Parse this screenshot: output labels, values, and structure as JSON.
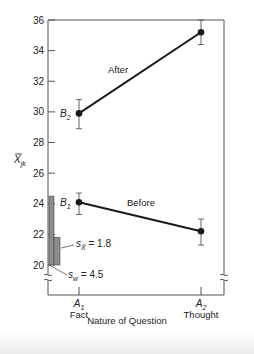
{
  "chart_data": {
    "type": "line",
    "title": "",
    "xlabel": "Nature of Question",
    "ylabel": "X̄jk",
    "ylabel_main": "X",
    "ylabel_sub": "jk",
    "ylim": [
      20,
      36
    ],
    "yticks": [
      20,
      22,
      24,
      26,
      28,
      30,
      32,
      34,
      36
    ],
    "axis_break": true,
    "grid": false,
    "legend": "inline labels",
    "categories": [
      {
        "symbol": "A",
        "sub": "1",
        "name": "Fact"
      },
      {
        "symbol": "A",
        "sub": "2",
        "name": "Thought"
      }
    ],
    "series": [
      {
        "name": "After",
        "label": "B",
        "label_sub": "2",
        "values": [
          29.9,
          35.2
        ],
        "error_low": [
          28.9,
          34.4
        ],
        "error_high": [
          30.8,
          36.0
        ]
      },
      {
        "name": "Before",
        "label": "B",
        "label_sub": "1",
        "values": [
          24.1,
          22.2
        ],
        "error_low": [
          23.3,
          21.3
        ],
        "error_high": [
          24.7,
          23.0
        ]
      }
    ],
    "annotations": [
      {
        "text_main": "s",
        "text_sub": "X̄",
        "text_value": "= 1.8",
        "bar_from": 20,
        "bar_to": 21.8
      },
      {
        "text_main": "s",
        "text_sub": "w",
        "text_value": "= 4.5",
        "bar_from": 20,
        "bar_to": 24.5
      }
    ]
  },
  "colors": {
    "line": "#1a1a1a",
    "axis": "#555555",
    "bar_fill": "#8c8c8c",
    "bar_stroke": "#444444"
  }
}
